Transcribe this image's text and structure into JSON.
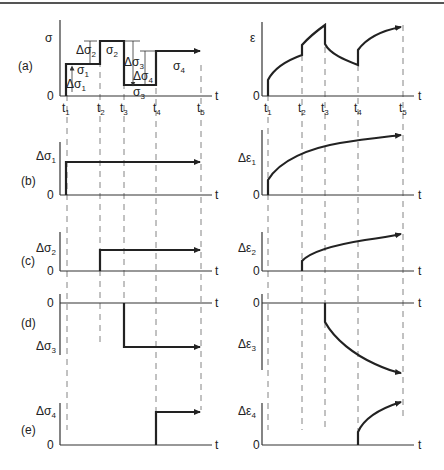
{
  "figure": {
    "rows": [
      {
        "id": "a",
        "label": "(a)",
        "left_ylabel": "σ",
        "right_ylabel": "ε"
      },
      {
        "id": "b",
        "label": "(b)",
        "left_ylabel": "Δσ",
        "left_sub": "1",
        "right_ylabel": "Δε",
        "right_sub": "1"
      },
      {
        "id": "c",
        "label": "(c)",
        "left_ylabel": "Δσ",
        "left_sub": "2",
        "right_ylabel": "Δε",
        "right_sub": "2"
      },
      {
        "id": "d",
        "label": "(d)",
        "left_ylabel": "Δσ",
        "left_sub": "3",
        "right_ylabel": "Δε",
        "right_sub": "3"
      },
      {
        "id": "e",
        "label": "(e)",
        "left_ylabel": "Δσ",
        "left_sub": "4",
        "right_ylabel": "Δε",
        "right_sub": "4"
      }
    ],
    "zero": "0",
    "t_axis": "t",
    "time_ticks": [
      "t",
      "t",
      "t",
      "t",
      "t"
    ],
    "time_subs": [
      "1",
      "2",
      "3",
      "4",
      "5"
    ],
    "stress_annotations": {
      "sigma1": {
        "main": "σ",
        "sub": "1"
      },
      "sigma2": {
        "main": "σ",
        "sub": "2"
      },
      "sigma3": {
        "main": "σ",
        "sub": "3"
      },
      "sigma4": {
        "main": "σ",
        "sub": "4"
      },
      "dsigma1": {
        "main": "Δσ",
        "sub": "1"
      },
      "dsigma2": {
        "main": "Δσ",
        "sub": "2"
      },
      "dsigma3": {
        "main": "Δσ",
        "sub": "3"
      },
      "dsigma4": {
        "main": "Δσ",
        "sub": "4"
      }
    }
  }
}
